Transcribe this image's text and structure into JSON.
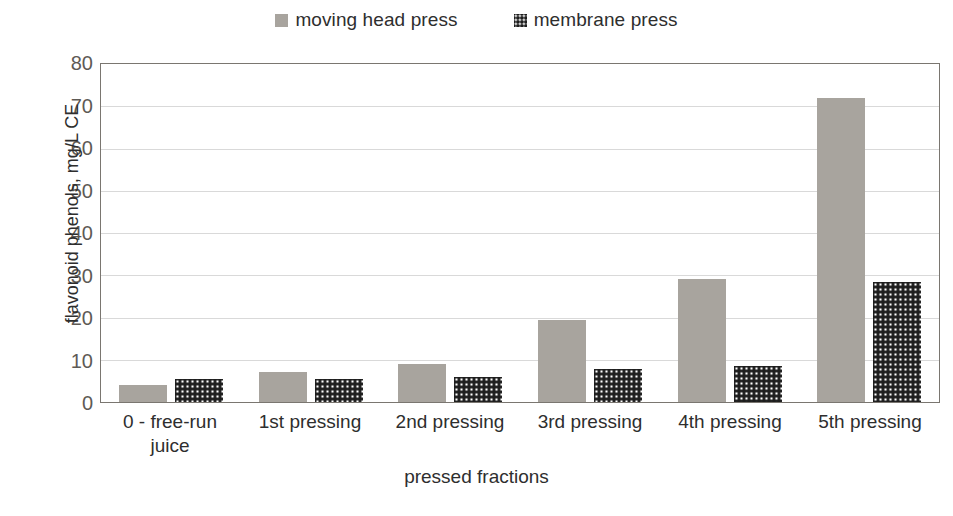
{
  "chart_data": {
    "type": "bar",
    "title": "",
    "xlabel": "pressed fractions",
    "ylabel": "flavonoid phenols, mg/L CE",
    "ylim": [
      0,
      80
    ],
    "ytick_step": 10,
    "yticks": [
      80,
      70,
      60,
      50,
      40,
      30,
      20,
      10,
      0
    ],
    "grid": true,
    "legend_position": "top-center",
    "categories": [
      "0 - free-run juice",
      "1st pressing",
      "2nd pressing",
      "3rd pressing",
      "4th pressing",
      "5th pressing"
    ],
    "series": [
      {
        "name": "moving head press",
        "color": "#a8a49e",
        "pattern": "solid",
        "values": [
          4,
          7,
          9,
          19.3,
          29,
          72
        ]
      },
      {
        "name": "membrane press",
        "color": "#1d1d1d",
        "pattern": "dotted",
        "values": [
          5.5,
          5.5,
          6,
          7.8,
          8.5,
          28.5
        ]
      }
    ]
  },
  "legend": {
    "items": [
      {
        "label": "moving head press",
        "swatch": "solid-gray-square"
      },
      {
        "label": "membrane press",
        "swatch": "dotted-dark-square"
      }
    ]
  }
}
